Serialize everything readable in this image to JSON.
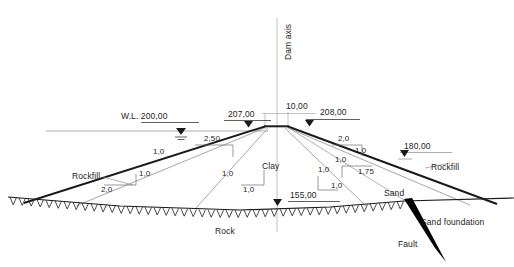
{
  "figure": {
    "type": "engineering-cross-section",
    "axis_label": "Dam axis"
  },
  "elevations": {
    "water_level": "W.L. 200,00",
    "upstream_crest": "207,00",
    "downstream_crest": "208,00",
    "downstream_toe": "180,00",
    "foundation_level": "155,00"
  },
  "dimensions": {
    "crest_width": "10,00"
  },
  "materials": {
    "core": "Clay",
    "upstream_shell": "Rockfill",
    "downstream_shell": "Rockfill",
    "rock_foundation": "Rock",
    "sand": "Sand",
    "sand_foundation": "Sand foundation",
    "fault": "Fault"
  },
  "slopes": {
    "upstream_outer_v": "1,0",
    "upstream_outer_h": "2,50",
    "upstream_mid_v": "1,0",
    "upstream_mid_h": "2,0",
    "upstream_core_v": "1,0",
    "upstream_core_h": "1,0",
    "downstream_outer_v": "1,0",
    "downstream_outer_h": "2,0",
    "downstream_mid_v": "1,0",
    "downstream_mid_h": "1,75",
    "downstream_core_v": "1,0",
    "downstream_core_h": "1,0"
  },
  "colors": {
    "line": "#1a1a1a",
    "thin": "#808080",
    "dim": "#9a9a9a",
    "fault": "#000000"
  }
}
